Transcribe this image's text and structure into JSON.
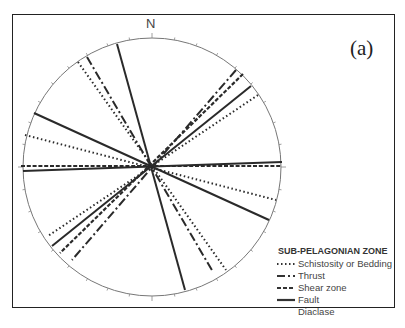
{
  "diagram": {
    "north_label": "N",
    "panel_label": "(a)",
    "legend": {
      "title": "SUB-PELAGONIAN ZONE",
      "items": [
        {
          "label": "Schistosity or Bedding",
          "style": "dotted"
        },
        {
          "label": "Thrust",
          "style": "dash-dot"
        },
        {
          "label": "Shear zone",
          "style": "dashed"
        },
        {
          "label": "Fault",
          "style": "solid"
        },
        {
          "label": "Diaclase",
          "style": "none"
        }
      ]
    },
    "stereonet": {
      "center": [
        152,
        167
      ],
      "radius": 129,
      "lines": [
        {
          "type": "Fault",
          "style": "solid",
          "from": [
            117,
            44
          ],
          "to": [
            185,
            290
          ]
        },
        {
          "type": "Thrust",
          "style": "dash-dot",
          "from": [
            87,
            57
          ],
          "to": [
            213,
            272
          ]
        },
        {
          "type": "Schistosity or Bedding",
          "style": "dotted",
          "from": [
            78,
            62
          ],
          "to": [
            226,
            270
          ]
        },
        {
          "type": "Fault",
          "style": "solid",
          "from": [
            34,
            113
          ],
          "to": [
            269,
            220
          ]
        },
        {
          "type": "Schistosity or Bedding",
          "style": "dotted",
          "from": [
            25,
            135
          ],
          "to": [
            276,
            200
          ]
        },
        {
          "type": "Shear zone",
          "style": "dashed",
          "from": [
            21,
            166
          ],
          "to": [
            282,
            166
          ]
        },
        {
          "type": "Fault",
          "style": "solid",
          "from": [
            23,
            171
          ],
          "to": [
            282,
            162
          ]
        },
        {
          "type": "Thrust",
          "style": "dash-dot",
          "from": [
            236,
            70
          ],
          "to": [
            72,
            260
          ]
        },
        {
          "type": "Shear zone",
          "style": "dashed",
          "from": [
            243,
            74
          ],
          "to": [
            60,
            253
          ]
        },
        {
          "type": "Fault",
          "style": "solid",
          "from": [
            251,
            86
          ],
          "to": [
            52,
            246
          ]
        },
        {
          "type": "Schistosity or Bedding",
          "style": "dotted",
          "from": [
            258,
            95
          ],
          "to": [
            48,
            236
          ]
        }
      ]
    }
  }
}
